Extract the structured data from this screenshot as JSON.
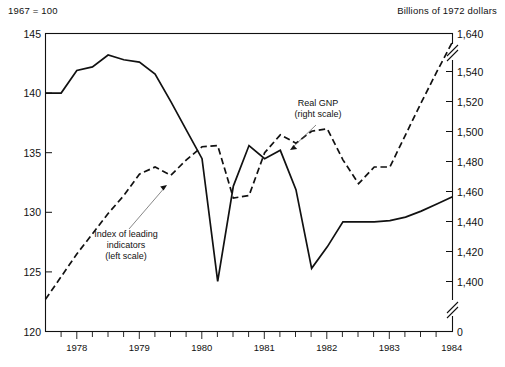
{
  "header": {
    "left_note": "1967 = 100",
    "right_note": "Billions of 1972 dollars"
  },
  "chart_data": {
    "type": "line",
    "title": "",
    "subtitle": "",
    "xlabel": "",
    "ylabel": "1967 = 100",
    "y2label": "Billions of 1972 dollars",
    "grid": false,
    "legend_position": "inline-annotations",
    "xlim": [
      1977.5,
      1984.0
    ],
    "x_tick_labels": [
      "1978",
      "1979",
      "1980",
      "1981",
      "1982",
      "1983",
      "1984"
    ],
    "x_tick_values": [
      1978,
      1979,
      1980,
      1981,
      1982,
      1983,
      1984
    ],
    "x_minor_tick_interval": 0.25,
    "left_axis": {
      "label": "1967 = 100",
      "ylim": [
        120,
        145
      ],
      "tick_labels": [
        "120",
        "125",
        "130",
        "135",
        "140",
        "145"
      ],
      "tick_values": [
        120,
        125,
        130,
        135,
        140,
        145
      ]
    },
    "right_axis": {
      "label": "Billions of 1972 dollars",
      "tick_labels": [
        "0",
        "1,400",
        "1,420",
        "1,440",
        "1,460",
        "1,480",
        "1,500",
        "1,520",
        "1,540",
        "1,640"
      ],
      "tick_values": [
        0,
        1400,
        1420,
        1440,
        1460,
        1480,
        1500,
        1520,
        1540,
        1640
      ],
      "axis_breaks": [
        "between 1,540 and 1,640",
        "between 0 and 1,400"
      ],
      "break_symbol": "double-slash"
    },
    "series": [
      {
        "name": "Index of leading indicators (left scale)",
        "style": "solid",
        "scale": "left",
        "annotation": {
          "text_lines": [
            "Index of leading",
            "indicators",
            "(left scale)"
          ],
          "points_to": "1979.6"
        },
        "x": [
          1977.5,
          1977.75,
          1978.0,
          1978.25,
          1978.5,
          1978.75,
          1979.0,
          1979.25,
          1979.5,
          1979.75,
          1980.0,
          1980.25,
          1980.5,
          1980.75,
          1981.0,
          1981.25,
          1981.5,
          1981.75,
          1982.0,
          1982.25,
          1982.5,
          1982.75,
          1983.0,
          1983.25,
          1983.5,
          1983.75,
          1984.0
        ],
        "values": [
          140.0,
          140.0,
          141.9,
          142.2,
          143.2,
          142.8,
          142.6,
          141.6,
          139.3,
          136.9,
          134.5,
          124.2,
          132.2,
          135.6,
          134.5,
          135.2,
          131.9,
          125.3,
          127.1,
          129.2,
          129.2,
          129.2,
          129.3,
          129.6,
          130.1,
          130.7,
          131.3
        ]
      },
      {
        "name": "Real GNP (right scale)",
        "style": "dashed",
        "scale": "right",
        "annotation": {
          "text_lines": [
            "Real GNP",
            "(right scale)"
          ],
          "points_to": "1981.35"
        },
        "x": [
          1977.5,
          1977.75,
          1978.0,
          1978.25,
          1978.5,
          1978.75,
          1979.0,
          1979.25,
          1979.5,
          1979.75,
          1980.0,
          1980.25,
          1980.5,
          1980.75,
          1981.0,
          1981.25,
          1981.5,
          1981.75,
          1982.0,
          1982.25,
          1982.5,
          1982.75,
          1983.0,
          1983.25,
          1983.5,
          1983.75,
          1984.0
        ],
        "values_left_equiv": [
          122.7,
          124.6,
          126.5,
          128.2,
          129.9,
          131.4,
          133.2,
          133.8,
          133.1,
          134.4,
          135.5,
          135.6,
          131.2,
          131.4,
          135.0,
          136.5,
          135.8,
          136.8,
          137.0,
          134.4,
          132.4,
          133.8,
          133.8,
          136.5,
          139.2,
          141.8,
          144.3
        ],
        "values_right_scale": [
          1390.0,
          1404.0,
          1418.0,
          1430.0,
          1442.0,
          1453.0,
          1466.0,
          1471.0,
          1466.0,
          1476.0,
          1483.0,
          1484.0,
          1452.0,
          1453.0,
          1479.0,
          1490.0,
          1485.0,
          1493.0,
          1494.0,
          1476.0,
          1461.0,
          1471.0,
          1471.0,
          1490.0,
          1510.0,
          1529.0,
          1547.0
        ]
      }
    ]
  }
}
